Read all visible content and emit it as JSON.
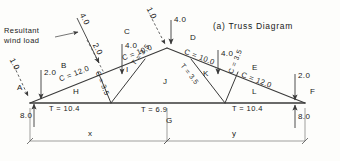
{
  "title": "(a) Truss Diagram",
  "annotation": {
    "resultant_wind_load": "Resultant\nwind load"
  },
  "colors": {
    "line": "#3a3a3a",
    "text": "#1a1a1a",
    "dimension": "#555555"
  },
  "loads": [
    {
      "id": "wind-resultant",
      "label": "4.0"
    },
    {
      "id": "wind-component",
      "label": "2.0"
    },
    {
      "id": "load-at-C",
      "label": "4.0"
    },
    {
      "id": "apex-incline",
      "label": "1.0"
    },
    {
      "id": "load-at-apex",
      "label": "4.0"
    },
    {
      "id": "load-at-K",
      "label": "4.0"
    },
    {
      "id": "load-at-A-incline",
      "label": "1.0"
    },
    {
      "id": "load-at-A-vertical",
      "label": "2.0"
    },
    {
      "id": "load-at-F",
      "label": "2.0"
    }
  ],
  "reactions": [
    {
      "id": "reaction-left",
      "label": "8.0"
    },
    {
      "id": "reaction-right",
      "label": "8.0"
    }
  ],
  "joints": [
    {
      "id": "A",
      "label": "A"
    },
    {
      "id": "F",
      "label": "F"
    }
  ],
  "spaces": [
    {
      "id": "B",
      "label": "B"
    },
    {
      "id": "C",
      "label": "C"
    },
    {
      "id": "D",
      "label": "D"
    },
    {
      "id": "E",
      "label": "E"
    },
    {
      "id": "G",
      "label": "G"
    },
    {
      "id": "H",
      "label": "H"
    },
    {
      "id": "I",
      "label": "I"
    },
    {
      "id": "J",
      "label": "J"
    },
    {
      "id": "K",
      "label": "K"
    },
    {
      "id": "L",
      "label": "L"
    }
  ],
  "members": [
    {
      "id": "rafter-lower-left",
      "label": "C = 12.0"
    },
    {
      "id": "rafter-upper-left",
      "label": "C = 10.0"
    },
    {
      "id": "rafter-upper-right",
      "label": "C = 10.0"
    },
    {
      "id": "rafter-lower-right",
      "label": "C = 12.0"
    },
    {
      "id": "web-left-strut",
      "label": "C = 3.5"
    },
    {
      "id": "web-left-tie",
      "label": "T = 3.5"
    },
    {
      "id": "web-right-tie",
      "label": "T = 3.5"
    },
    {
      "id": "web-right-strut",
      "label": "C = 3.5"
    },
    {
      "id": "chord-left",
      "label": "T = 10.4"
    },
    {
      "id": "chord-center",
      "label": "T = 6.9"
    },
    {
      "id": "chord-right",
      "label": "T = 10.4"
    }
  ],
  "dimensions": [
    {
      "id": "dim-x",
      "label": "x"
    },
    {
      "id": "dim-y",
      "label": "y"
    }
  ]
}
